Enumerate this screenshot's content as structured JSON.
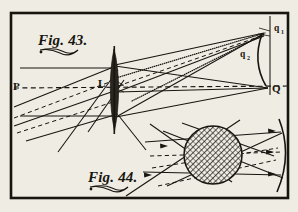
{
  "plate": {
    "background_color": "#efece4",
    "ink_color": "#17150f",
    "frame": {
      "name": "plate-border",
      "x": 11,
      "y": 13,
      "width": 277,
      "height": 185
    }
  },
  "figures": [
    {
      "id": "fig43",
      "label": "Fig. 43.",
      "caption_position": {
        "x": 38,
        "y": 45
      },
      "description": "Converging lens L on axis P-Q with oblique ray pencils forming images at q1, q2 and Q",
      "points": [
        {
          "name": "P",
          "label": "P",
          "x": 16,
          "y": 86,
          "role": "object-axis-point-left"
        },
        {
          "name": "L",
          "label": "L",
          "x": 105,
          "y": 83,
          "role": "lens-center-label"
        },
        {
          "name": "Q",
          "label": "Q",
          "x": 268,
          "y": 89,
          "role": "axial-image-point"
        },
        {
          "name": "q1",
          "label": "q",
          "subscript": "1",
          "x": 268,
          "y": 32,
          "role": "oblique-image-point-1"
        },
        {
          "name": "q2",
          "label": "q",
          "subscript": "2",
          "x": 243,
          "y": 55,
          "role": "oblique-image-point-2"
        }
      ],
      "elements": [
        "optical-axis-dashed",
        "biconvex-lens",
        "vertical-image-screen-line",
        "solid-ray-pencil",
        "dashed-ray-pencil",
        "dotted-ray-pencil",
        "astigmatism-arc"
      ]
    },
    {
      "id": "fig44",
      "label": "Fig. 44.",
      "caption_position": {
        "x": 88,
        "y": 182
      },
      "description": "Hatched refracting sphere with ray pencils converging on a concave mirror arc at right",
      "elements": [
        "hatched-sphere",
        "concave-mirror-arc",
        "incident-rays",
        "reflected-rays",
        "dashed-axis"
      ]
    }
  ]
}
